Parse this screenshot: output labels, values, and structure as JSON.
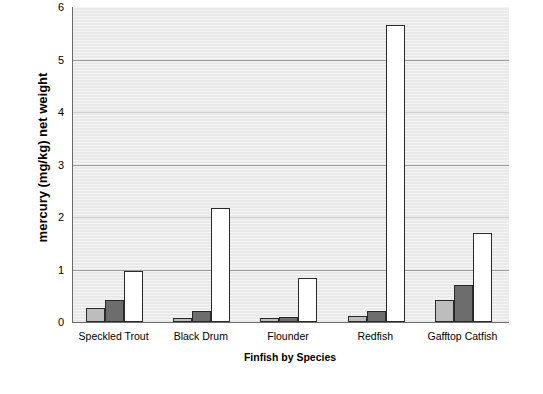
{
  "chart_data": {
    "type": "bar",
    "title": "",
    "xlabel": "Finfish by Species",
    "ylabel": "mercury (mg/kg) net weight",
    "categories": [
      "Speckled Trout",
      "Black Drum",
      "Flounder",
      "Redfish",
      "Gafftop Catfish"
    ],
    "series": [
      {
        "name": "series-1",
        "values": [
          0.26,
          0.08,
          0.08,
          0.12,
          0.42
        ]
      },
      {
        "name": "series-2",
        "values": [
          0.42,
          0.21,
          0.1,
          0.21,
          0.7
        ]
      },
      {
        "name": "series-3",
        "values": [
          0.97,
          2.18,
          0.84,
          5.66,
          1.7
        ]
      }
    ],
    "ylim": [
      0,
      6
    ],
    "ytick_labels": [
      "0",
      "1",
      "2",
      "3",
      "4",
      "5",
      "6"
    ],
    "ytick_values": [
      0,
      1,
      2,
      3,
      4,
      5,
      6
    ],
    "grid": true,
    "legend": "none",
    "plot_background": "#e9e9e9",
    "gridline_color": "#9a9a9a",
    "axis_color": "#6a6a6a",
    "series_colors": [
      "#bdbdbd",
      "#6d6d6d",
      "#ffffff"
    ],
    "bar_outline_color": "#2a2a2a"
  }
}
